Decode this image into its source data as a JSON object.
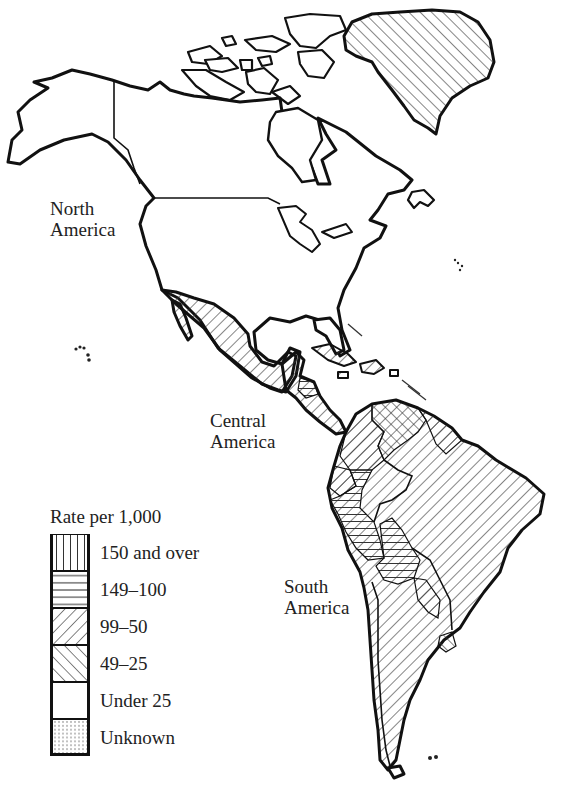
{
  "labels": {
    "north_america": [
      "North",
      "America"
    ],
    "central_america": [
      "Central",
      "America"
    ],
    "south_america": [
      "South",
      "America"
    ]
  },
  "legend": {
    "title": "Rate per 1,000",
    "items": [
      {
        "label": "150 and over",
        "pattern": "vertical-hatch"
      },
      {
        "label": "149–100",
        "pattern": "horizontal-hatch"
      },
      {
        "label": "99–50",
        "pattern": "backslash-hatch"
      },
      {
        "label": "49–25",
        "pattern": "forwardslash-hatch"
      },
      {
        "label": "Under 25",
        "pattern": "blank"
      },
      {
        "label": "Unknown",
        "pattern": "dotted"
      }
    ]
  },
  "regions": [
    {
      "name": "Alaska",
      "category": "Under 25"
    },
    {
      "name": "Canada",
      "category": "Under 25"
    },
    {
      "name": "United States",
      "category": "Under 25"
    },
    {
      "name": "Greenland",
      "category": "49–25"
    },
    {
      "name": "Mexico",
      "category": "99–50"
    },
    {
      "name": "Central America (Guatemala, Honduras, El Salvador)",
      "category": "99–50"
    },
    {
      "name": "Nicaragua",
      "category": "149–100"
    },
    {
      "name": "Costa Rica / Panama",
      "category": "99–50"
    },
    {
      "name": "Cuba / Caribbean islands",
      "category": "99–50"
    },
    {
      "name": "Colombia",
      "category": "99–50"
    },
    {
      "name": "Venezuela",
      "category": "49–25"
    },
    {
      "name": "Guianas",
      "category": "99–50"
    },
    {
      "name": "Ecuador",
      "category": "99–50"
    },
    {
      "name": "Peru",
      "category": "149–100"
    },
    {
      "name": "Bolivia",
      "category": "149–100"
    },
    {
      "name": "Brazil",
      "category": "99–50"
    },
    {
      "name": "Paraguay",
      "category": "99–50"
    },
    {
      "name": "Uruguay",
      "category": "49–25"
    },
    {
      "name": "Chile",
      "category": "99–50"
    },
    {
      "name": "Argentina",
      "category": "99–50"
    },
    {
      "name": "Hawaii",
      "category": "Under 25"
    }
  ]
}
